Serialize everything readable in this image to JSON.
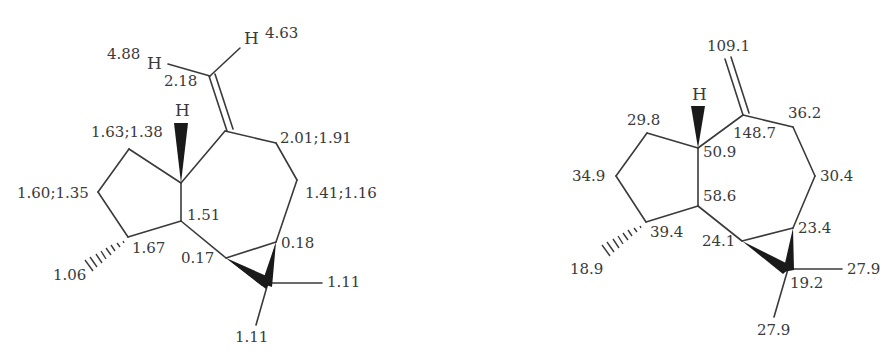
{
  "figure": {
    "colors": {
      "ink": "#3a3a3a",
      "background": "#ffffff"
    },
    "left_structure": {
      "description": "1H NMR chemical shifts (ppm)",
      "atoms": {
        "H_exo_left": "H",
        "H_exo_right": "H",
        "H_bridgehead": "H"
      },
      "labels": [
        {
          "id": "h_4_63",
          "text": "4.63"
        },
        {
          "id": "h_4_88",
          "text": "4.88"
        },
        {
          "id": "h_2_18",
          "text": "2.18"
        },
        {
          "id": "h_1_63_1_38",
          "text": "1.63;1.38"
        },
        {
          "id": "h_2_01_1_91",
          "text": "2.01;1.91"
        },
        {
          "id": "h_1_60_1_35",
          "text": "1.60;1.35"
        },
        {
          "id": "h_1_41_1_16",
          "text": "1.41;1.16"
        },
        {
          "id": "h_1_51",
          "text": "1.51"
        },
        {
          "id": "h_1_67",
          "text": "1.67"
        },
        {
          "id": "h_0_17",
          "text": "0.17"
        },
        {
          "id": "h_0_18",
          "text": "0.18"
        },
        {
          "id": "h_1_06",
          "text": "1.06"
        },
        {
          "id": "h_1_11_right",
          "text": "1.11"
        },
        {
          "id": "h_1_11_bottom",
          "text": "1.11"
        }
      ]
    },
    "right_structure": {
      "description": "13C NMR chemical shifts (ppm)",
      "atoms": {
        "H_bridgehead": "H"
      },
      "labels": [
        {
          "id": "c_109_1",
          "text": "109.1"
        },
        {
          "id": "c_29_8",
          "text": "29.8"
        },
        {
          "id": "c_36_2",
          "text": "36.2"
        },
        {
          "id": "c_148_7",
          "text": "148.7"
        },
        {
          "id": "c_50_9",
          "text": "50.9"
        },
        {
          "id": "c_34_9",
          "text": "34.9"
        },
        {
          "id": "c_30_4",
          "text": "30.4"
        },
        {
          "id": "c_58_6",
          "text": "58.6"
        },
        {
          "id": "c_39_4",
          "text": "39.4"
        },
        {
          "id": "c_24_1",
          "text": "24.1"
        },
        {
          "id": "c_23_4",
          "text": "23.4"
        },
        {
          "id": "c_18_9",
          "text": "18.9"
        },
        {
          "id": "c_27_9_right",
          "text": "27.9"
        },
        {
          "id": "c_19_2",
          "text": "19.2"
        },
        {
          "id": "c_27_9_bottom",
          "text": "27.9"
        }
      ]
    }
  }
}
